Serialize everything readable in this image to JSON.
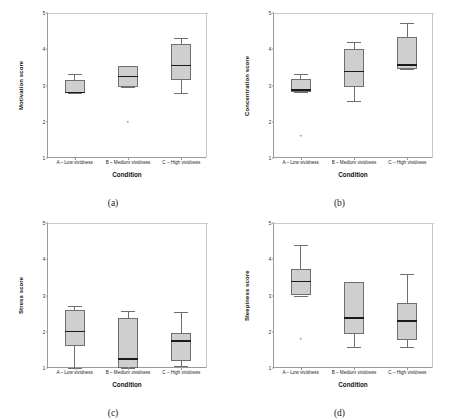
{
  "figure": {
    "layout": "2x2-grid",
    "categories": [
      "A – Low vividness",
      "B – Medium vividness",
      "C – High vividness"
    ],
    "xlabel": "Condition",
    "yticks": [
      "1",
      "2",
      "3",
      "4",
      "5"
    ],
    "ylim": [
      1,
      5
    ],
    "box_fill": "#cfcfcf",
    "box_stroke": "#6f6f6f",
    "median_color": "#1b1b1b"
  },
  "chart_data": [
    {
      "type": "box",
      "panel": "a",
      "caption": "(a)",
      "title": "",
      "xlabel": "Condition",
      "ylabel": "Motivation score",
      "ylim": [
        1,
        5
      ],
      "yticks": [
        1,
        2,
        3,
        4,
        5
      ],
      "grid": false,
      "legend": "none",
      "categories": [
        "A – Low vividness",
        "B – Medium vividness",
        "C – High vividness"
      ],
      "boxes": [
        {
          "category": "A – Low vividness",
          "min": 2.78,
          "q1": 2.78,
          "median": 2.8,
          "q3": 3.15,
          "max": 3.32,
          "outliers": [
            1.0
          ]
        },
        {
          "category": "B – Medium vividness",
          "min": 2.97,
          "q1": 2.97,
          "median": 3.25,
          "q3": 3.55,
          "max": 3.55,
          "outliers": [
            2.0
          ]
        },
        {
          "category": "C – High vividness",
          "min": 2.78,
          "q1": 3.15,
          "median": 3.56,
          "q3": 4.14,
          "max": 4.3,
          "outliers": []
        }
      ]
    },
    {
      "type": "box",
      "panel": "b",
      "caption": "(b)",
      "title": "",
      "xlabel": "Condition",
      "ylabel": "Concentration score",
      "ylim": [
        1,
        5
      ],
      "yticks": [
        1,
        2,
        3,
        4,
        5
      ],
      "grid": false,
      "legend": "none",
      "categories": [
        "A – Low vividness",
        "B – Medium vividness",
        "C – High vividness"
      ],
      "boxes": [
        {
          "category": "A – Low vividness",
          "min": 2.82,
          "q1": 2.82,
          "median": 2.88,
          "q3": 3.18,
          "max": 3.33,
          "outliers": [
            1.62
          ]
        },
        {
          "category": "B – Medium vividness",
          "min": 2.56,
          "q1": 2.97,
          "median": 3.38,
          "q3": 4.0,
          "max": 4.2,
          "outliers": []
        },
        {
          "category": "C – High vividness",
          "min": 3.45,
          "q1": 3.45,
          "median": 3.57,
          "q3": 4.35,
          "max": 4.72,
          "outliers": []
        }
      ]
    },
    {
      "type": "box",
      "panel": "c",
      "caption": "(c)",
      "title": "",
      "xlabel": "Condition",
      "ylabel": "Stress score",
      "ylim": [
        1,
        5
      ],
      "yticks": [
        1,
        2,
        3,
        4,
        5
      ],
      "grid": false,
      "legend": "none",
      "categories": [
        "A – Low vividness",
        "B – Medium vividness",
        "C – High vividness"
      ],
      "boxes": [
        {
          "category": "A – Low vividness",
          "min": 1.0,
          "q1": 1.62,
          "median": 2.0,
          "q3": 2.6,
          "max": 2.72,
          "outliers": []
        },
        {
          "category": "B – Medium vividness",
          "min": 1.0,
          "q1": 1.0,
          "median": 1.25,
          "q3": 2.38,
          "max": 2.58,
          "outliers": []
        },
        {
          "category": "C – High vividness",
          "min": 1.05,
          "q1": 1.18,
          "median": 1.75,
          "q3": 1.97,
          "max": 2.55,
          "outliers": []
        }
      ]
    },
    {
      "type": "box",
      "panel": "d",
      "caption": "(d)",
      "title": "",
      "xlabel": "Condition",
      "ylabel": "Sleepiness score",
      "ylim": [
        1,
        5
      ],
      "yticks": [
        1,
        2,
        3,
        4,
        5
      ],
      "grid": false,
      "legend": "none",
      "categories": [
        "A – Low vividness",
        "B – Medium vividness",
        "C – High vividness"
      ],
      "boxes": [
        {
          "category": "A – Low vividness",
          "min": 3.0,
          "q1": 3.0,
          "median": 3.38,
          "q3": 3.72,
          "max": 4.38,
          "outliers": [
            1.8
          ]
        },
        {
          "category": "B – Medium vividness",
          "min": 1.58,
          "q1": 1.95,
          "median": 2.38,
          "q3": 3.38,
          "max": 3.38,
          "outliers": []
        },
        {
          "category": "C – High vividness",
          "min": 1.58,
          "q1": 1.78,
          "median": 2.3,
          "q3": 2.8,
          "max": 3.58,
          "outliers": []
        }
      ]
    }
  ]
}
